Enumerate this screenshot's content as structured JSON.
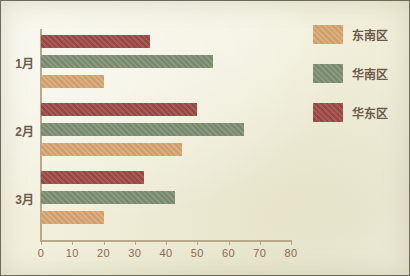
{
  "chart_data": {
    "type": "bar",
    "orientation": "horizontal",
    "title": "",
    "xlabel": "",
    "ylabel": "",
    "categories": [
      "1月",
      "2月",
      "3月"
    ],
    "series": [
      {
        "name": "东南区",
        "color": "#d9a571",
        "values": [
          20,
          45,
          20
        ]
      },
      {
        "name": "华南区",
        "color": "#7d8f72",
        "values": [
          55,
          65,
          43
        ]
      },
      {
        "name": "华东区",
        "color": "#9e4a46",
        "values": [
          35,
          50,
          33
        ]
      }
    ],
    "bar_order_in_group_top_to_bottom": [
      "华东区",
      "华南区",
      "东南区"
    ],
    "xlim": [
      0,
      80
    ],
    "xticks": [
      0,
      10,
      20,
      30,
      40,
      50,
      60,
      70,
      80
    ],
    "xtick_labels": [
      "0",
      "10",
      "20",
      "30",
      "40",
      "50",
      "60",
      "70",
      "80"
    ],
    "grid": false,
    "legend_position": "right"
  },
  "legend": {
    "entries": [
      {
        "label": "东南区",
        "color": "#d9a571"
      },
      {
        "label": "华南区",
        "color": "#7d8f72"
      },
      {
        "label": "华东区",
        "color": "#9e4a46"
      }
    ]
  },
  "colors": {
    "background": "#f3f1dd",
    "border": "#6b6a5c",
    "axis": "#b8a98c",
    "tick_text": "#8c6a52",
    "category_text": "#6d5b4a"
  }
}
